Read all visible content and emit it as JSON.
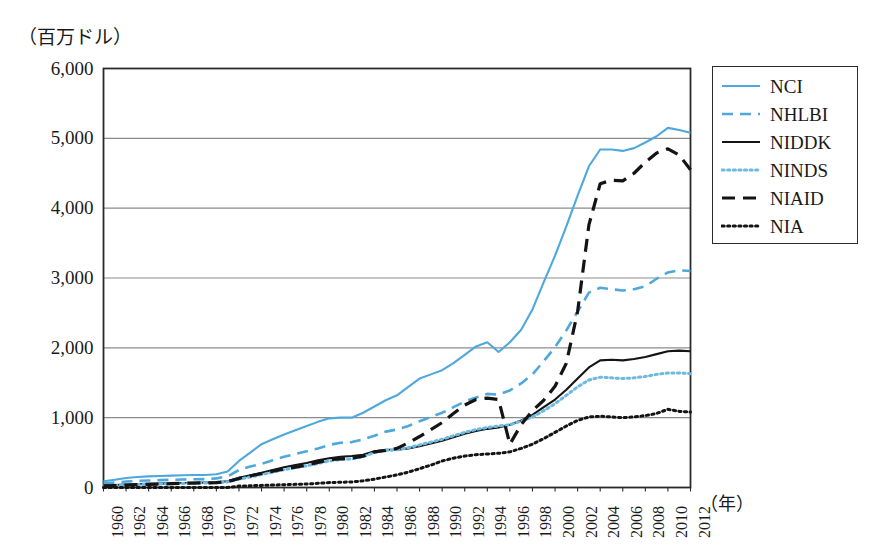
{
  "figure": {
    "y_unit_label": "（百万ドル）",
    "x_unit_label": "（年）"
  },
  "chart_data": {
    "type": "line",
    "title": "",
    "subtitle": "",
    "xlabel": "（年）",
    "ylabel": "（百万ドル）",
    "xlim": [
      1960,
      2012
    ],
    "ylim": [
      0,
      6000
    ],
    "grid": "horizontal",
    "legend_position": "right-top",
    "ytick_labels": [
      "0",
      "1,000",
      "2,000",
      "3,000",
      "4,000",
      "5,000",
      "6,000"
    ],
    "ytick_values": [
      0,
      1000,
      2000,
      3000,
      4000,
      5000,
      6000
    ],
    "xtick_labels": [
      "1960",
      "1962",
      "1964",
      "1966",
      "1968",
      "1970",
      "1972",
      "1974",
      "1976",
      "1978",
      "1980",
      "1982",
      "1984",
      "1986",
      "1988",
      "1990",
      "1992",
      "1994",
      "1996",
      "1998",
      "2000",
      "2002",
      "2004",
      "2006",
      "2008",
      "2010",
      "2012"
    ],
    "xtick_values": [
      1960,
      1962,
      1964,
      1966,
      1968,
      1970,
      1972,
      1974,
      1976,
      1978,
      1980,
      1982,
      1984,
      1986,
      1988,
      1990,
      1992,
      1994,
      1996,
      1998,
      2000,
      2002,
      2004,
      2006,
      2008,
      2010,
      2012
    ],
    "x": [
      1960,
      1961,
      1962,
      1963,
      1964,
      1965,
      1966,
      1967,
      1968,
      1969,
      1970,
      1971,
      1972,
      1973,
      1974,
      1975,
      1976,
      1977,
      1978,
      1979,
      1980,
      1981,
      1982,
      1983,
      1984,
      1985,
      1986,
      1987,
      1988,
      1989,
      1990,
      1991,
      1992,
      1993,
      1994,
      1995,
      1996,
      1997,
      1998,
      1999,
      2000,
      2001,
      2002,
      2003,
      2004,
      2005,
      2006,
      2007,
      2008,
      2009,
      2010,
      2011,
      2012
    ],
    "series": [
      {
        "name": "NCI",
        "color": "#4FA8DC",
        "style": "solid",
        "values": [
          90,
          110,
          135,
          150,
          160,
          165,
          170,
          175,
          180,
          180,
          190,
          230,
          380,
          500,
          620,
          690,
          760,
          820,
          880,
          940,
          990,
          1000,
          1000,
          1070,
          1160,
          1250,
          1320,
          1440,
          1560,
          1620,
          1680,
          1780,
          1900,
          2020,
          2080,
          1940,
          2080,
          2260,
          2550,
          2940,
          3320,
          3740,
          4180,
          4600,
          4840,
          4840,
          4820,
          4860,
          4940,
          5030,
          5150,
          5120,
          5080
        ]
      },
      {
        "name": "NHLBI",
        "color": "#4FA8DC",
        "style": "dashed",
        "values": [
          60,
          70,
          85,
          95,
          100,
          105,
          110,
          115,
          118,
          120,
          130,
          160,
          250,
          300,
          340,
          390,
          440,
          480,
          520,
          560,
          610,
          640,
          650,
          690,
          740,
          800,
          830,
          880,
          950,
          1010,
          1070,
          1150,
          1230,
          1290,
          1340,
          1330,
          1390,
          1490,
          1620,
          1810,
          2010,
          2250,
          2520,
          2790,
          2860,
          2840,
          2820,
          2840,
          2880,
          2990,
          3080,
          3110,
          3100
        ]
      },
      {
        "name": "NIDDK",
        "color": "#141414",
        "style": "solid",
        "values": [
          30,
          35,
          42,
          48,
          52,
          56,
          60,
          64,
          68,
          70,
          75,
          90,
          140,
          175,
          210,
          250,
          290,
          320,
          350,
          390,
          420,
          440,
          450,
          470,
          520,
          540,
          540,
          560,
          590,
          630,
          670,
          720,
          770,
          810,
          840,
          860,
          900,
          960,
          1040,
          1150,
          1260,
          1400,
          1560,
          1720,
          1820,
          1830,
          1820,
          1840,
          1870,
          1910,
          1950,
          1960,
          1950
        ]
      },
      {
        "name": "NINDS",
        "color": "#6DB9E0",
        "style": "dotted",
        "values": [
          25,
          30,
          36,
          42,
          46,
          50,
          54,
          58,
          62,
          64,
          68,
          80,
          120,
          150,
          185,
          220,
          255,
          285,
          310,
          345,
          380,
          400,
          410,
          440,
          500,
          530,
          540,
          570,
          610,
          650,
          690,
          740,
          790,
          830,
          860,
          880,
          900,
          950,
          1010,
          1100,
          1200,
          1320,
          1440,
          1540,
          1580,
          1570,
          1560,
          1570,
          1590,
          1620,
          1640,
          1640,
          1630
        ]
      },
      {
        "name": "NIAID",
        "color": "#141414",
        "style": "longdash",
        "values": [
          22,
          28,
          34,
          40,
          46,
          50,
          55,
          60,
          64,
          66,
          70,
          85,
          130,
          165,
          200,
          235,
          265,
          290,
          320,
          360,
          400,
          410,
          420,
          450,
          510,
          530,
          560,
          640,
          730,
          830,
          930,
          1060,
          1180,
          1260,
          1280,
          1260,
          620,
          900,
          1100,
          1250,
          1450,
          1780,
          2520,
          3760,
          4350,
          4400,
          4390,
          4500,
          4660,
          4790,
          4850,
          4760,
          4550
        ]
      },
      {
        "name": "NIA",
        "color": "#141414",
        "style": "dotted",
        "values": [
          0,
          0,
          0,
          0,
          0,
          0,
          0,
          0,
          0,
          0,
          0,
          0,
          20,
          25,
          30,
          35,
          40,
          45,
          50,
          60,
          70,
          75,
          80,
          95,
          120,
          150,
          180,
          220,
          270,
          320,
          380,
          420,
          450,
          470,
          480,
          490,
          510,
          560,
          620,
          700,
          790,
          880,
          960,
          1010,
          1020,
          1010,
          1000,
          1010,
          1030,
          1060,
          1120,
          1090,
          1080
        ]
      }
    ]
  },
  "legend": {
    "items": [
      {
        "label": "NCI"
      },
      {
        "label": "NHLBI"
      },
      {
        "label": "NIDDK"
      },
      {
        "label": "NINDS"
      },
      {
        "label": "NIAID"
      },
      {
        "label": "NIA"
      }
    ]
  }
}
